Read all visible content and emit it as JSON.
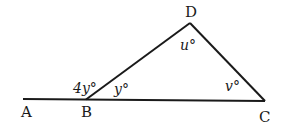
{
  "diagram": {
    "type": "geometry-triangle-with-extended-base",
    "stroke_color": "#1a1a1a",
    "points": {
      "A": {
        "label": "A"
      },
      "B": {
        "label": "B"
      },
      "C": {
        "label": "C"
      },
      "D": {
        "label": "D"
      }
    },
    "angles": {
      "exterior_B": "4y°",
      "interior_B": "y°",
      "angle_D": "u°",
      "angle_C": "v°"
    }
  }
}
